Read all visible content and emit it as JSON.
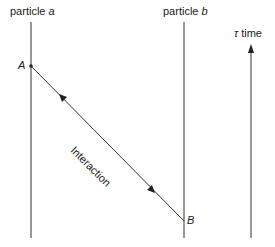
{
  "labels": {
    "particle_a_prefix": "particle ",
    "particle_a_var": "a",
    "particle_b_prefix": "particle ",
    "particle_b_var": "b",
    "time_symbol": "τ",
    "time_word": " time",
    "event_a": "A",
    "event_b": "B",
    "interaction": "Interaction"
  }
}
